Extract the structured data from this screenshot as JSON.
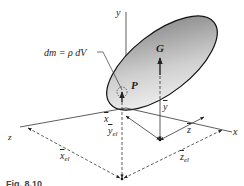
{
  "figure": {
    "axes": {
      "x_label": "x",
      "y_label": "y",
      "z_label": "z"
    },
    "points": {
      "center_of_mass_label": "G",
      "mass_element_label": "P"
    },
    "equation": "dm = ρ dV",
    "dimensions": {
      "x_bar": "x",
      "y_bar": "y",
      "z_bar": "z",
      "x_bar_el": "x",
      "y_bar_el": "y",
      "z_bar_el": "z",
      "el_subscript": "el"
    },
    "caption": "Fig. 8.10",
    "colors": {
      "line": "#333333",
      "body_fill_light": "#f2f2f2",
      "body_fill_dark": "#8a8a8a"
    }
  }
}
